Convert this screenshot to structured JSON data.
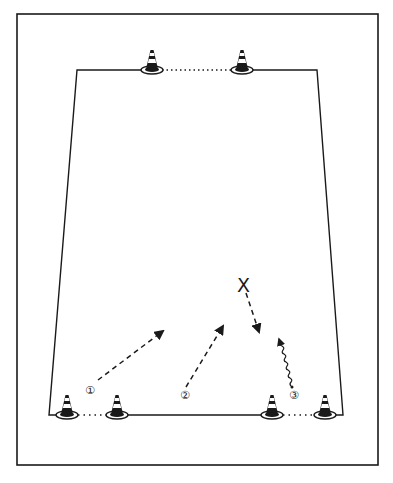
{
  "diagram": {
    "type": "soccer-drill",
    "frame": {
      "x": 17,
      "y": 14,
      "w": 361,
      "h": 451
    },
    "field": {
      "top_left": [
        77,
        70
      ],
      "top_right": [
        317,
        70
      ],
      "bottom_left": [
        49,
        415
      ],
      "bottom_right": [
        343,
        415
      ]
    },
    "cones": [
      {
        "id": "cone-top-left",
        "x": 152,
        "y": 70
      },
      {
        "id": "cone-top-right",
        "x": 242,
        "y": 70
      },
      {
        "id": "cone-bottom-1",
        "x": 67,
        "y": 415
      },
      {
        "id": "cone-bottom-2",
        "x": 117,
        "y": 415
      },
      {
        "id": "cone-bottom-3",
        "x": 272,
        "y": 415
      },
      {
        "id": "cone-bottom-4",
        "x": 325,
        "y": 415
      }
    ],
    "player_marker": {
      "label": "X",
      "x": 244,
      "y": 285
    },
    "labels": [
      {
        "text": "①",
        "x": 91,
        "y": 390
      },
      {
        "text": "②",
        "x": 186,
        "y": 397
      },
      {
        "text": "③",
        "x": 296,
        "y": 397
      }
    ],
    "colors": {
      "ink": "#1a1a1a",
      "background": "#ffffff"
    }
  }
}
